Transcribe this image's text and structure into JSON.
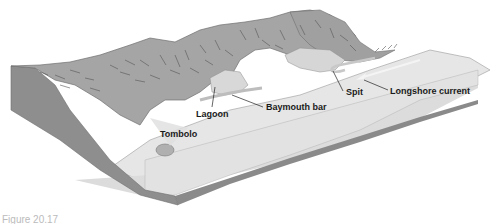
{
  "diagram": {
    "labels": {
      "lagoon": "Lagoon",
      "baymouth_bar": "Baymouth bar",
      "spit": "Spit",
      "longshore_current": "Longshore current",
      "tombolo": "Tombolo"
    },
    "caption": "Figure 20.17",
    "colors": {
      "land": "#a3a3a3",
      "land_side": "#8c8c8c",
      "water_top": "#e4e4e4",
      "water_side": "#dcdcdc",
      "bedrock_side": "#7f7f7f",
      "lagoon_water": "#d3d3d3",
      "hatch": "#555555",
      "label_text": "#1a1a1a"
    }
  }
}
